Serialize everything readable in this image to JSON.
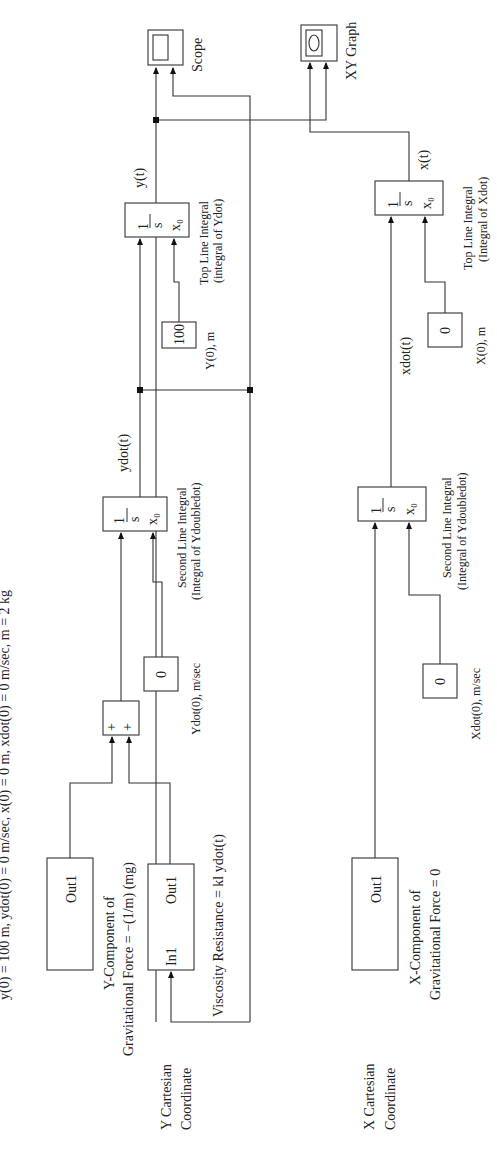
{
  "title": "y(0) = 100 m, ydot(0) = 0 m/sec, x(0) = 0 m, xdot(0) = 0 m/sec, m = 2 kg",
  "sinks": {
    "scope": {
      "label": "Scope"
    },
    "xy_graph": {
      "label": "XY Graph"
    }
  },
  "y_chain": {
    "coordinate_label_1": "Y Cartesian",
    "coordinate_label_2": "Coordinate",
    "gravity_block": {
      "port": "Out1",
      "caption_1": "Y-Component of",
      "caption_2": "Gravitational Force = −(1/m) (mg)"
    },
    "viscosity_block": {
      "in_port": "In1",
      "out_port": "Out1",
      "caption": "Viscosity Resistance = kl ydot(t)"
    },
    "sum_block": {
      "sign_1": "+",
      "sign_2": "+"
    },
    "second_integrator": {
      "num": "1",
      "den": "s",
      "ic": "x₀",
      "caption_1": "Second Line Integral",
      "caption_2": "(Integral of Ydoubledot)"
    },
    "ydot_ic": {
      "value": "0",
      "label": "Ydot(0), m/sec"
    },
    "ydot_signal": "ydot(t)",
    "top_integrator": {
      "num": "1",
      "den": "s",
      "ic": "x₀",
      "caption_1": "Top Line Integral",
      "caption_2": "(integral of Ydot)"
    },
    "y_ic": {
      "value": "100",
      "label": "Y(0), m"
    },
    "y_signal": "y(t)"
  },
  "x_chain": {
    "coordinate_label_1": "X Cartesian",
    "coordinate_label_2": "Coordinate",
    "gravity_block": {
      "port": "Out1",
      "caption_1": "X-Component of",
      "caption_2": "Gravitational Force = 0"
    },
    "second_integrator": {
      "num": "1",
      "den": "s",
      "ic": "x₀",
      "caption_1": "Second Line Integral",
      "caption_2": "(Integral of Ydoubledot)"
    },
    "xdot_ic": {
      "value": "0",
      "label": "Xdot(0), m/sec"
    },
    "xdot_signal": "xdot(t)",
    "top_integrator": {
      "num": "1",
      "den": "s",
      "ic": "x₀",
      "caption_1": "Top Line Integral",
      "caption_2": "(Integral of Xdot)"
    },
    "x_ic": {
      "value": "0",
      "label": "X(0), m"
    },
    "x_signal": "x(t)"
  }
}
